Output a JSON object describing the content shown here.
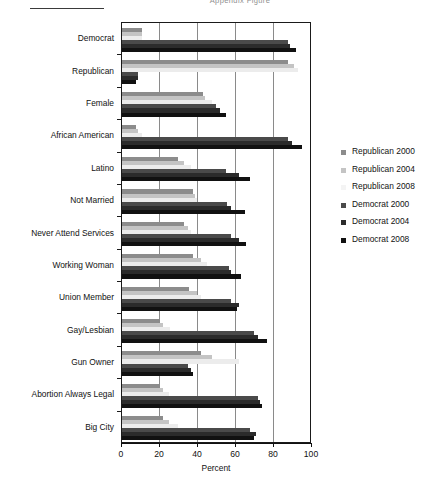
{
  "page": {
    "title_clipped": "Appendix Figure"
  },
  "chart_data": {
    "type": "bar",
    "orientation": "horizontal",
    "title": "Appendix Figure",
    "xlabel": "Percent",
    "ylabel": "",
    "xlim": [
      0,
      100
    ],
    "xticks": [
      0,
      20,
      40,
      60,
      80,
      100
    ],
    "grid": true,
    "legend_position": "right",
    "categories": [
      "Democrat",
      "Republican",
      "Female",
      "African American",
      "Latino",
      "Not Married",
      "Never Attend Services",
      "Working Woman",
      "Union Member",
      "Gay/Lesbian",
      "Gun Owner",
      "Abortion Always Legal",
      "Big City"
    ],
    "series": [
      {
        "name": "Republican 2000",
        "color": "#8c8c8c",
        "values": [
          11,
          88,
          43,
          8,
          30,
          38,
          33,
          38,
          36,
          20,
          42,
          20,
          22
        ]
      },
      {
        "name": "Republican 2004",
        "color": "#c4c4c4",
        "values": [
          11,
          91,
          44,
          9,
          33,
          39,
          35,
          42,
          40,
          22,
          48,
          22,
          25
        ]
      },
      {
        "name": "Republican 2008",
        "color": "#ececec",
        "values": [
          11,
          93,
          48,
          11,
          37,
          40,
          37,
          45,
          42,
          26,
          62,
          25,
          30
        ]
      },
      {
        "name": "Democrat 2000",
        "color": "#4a4a4a",
        "values": [
          88,
          9,
          50,
          88,
          55,
          56,
          58,
          57,
          58,
          70,
          35,
          72,
          68
        ]
      },
      {
        "name": "Democrat 2004",
        "color": "#2b2b2b",
        "values": [
          89,
          9,
          52,
          90,
          62,
          58,
          62,
          58,
          62,
          72,
          37,
          73,
          71
        ]
      },
      {
        "name": "Democrat 2008",
        "color": "#111111",
        "values": [
          92,
          8,
          55,
          95,
          68,
          65,
          66,
          63,
          61,
          77,
          38,
          74,
          70
        ]
      }
    ]
  },
  "legend": {
    "items": [
      {
        "label": "Republican 2000",
        "color": "#8c8c8c"
      },
      {
        "label": "Republican 2004",
        "color": "#c4c4c4"
      },
      {
        "label": "Republican 2008",
        "color": "#f4f4f4"
      },
      {
        "label": "Democrat 2000",
        "color": "#4a4a4a"
      },
      {
        "label": "Democrat 2004",
        "color": "#2b2b2b"
      },
      {
        "label": "Democrat 2008",
        "color": "#111111"
      }
    ]
  }
}
